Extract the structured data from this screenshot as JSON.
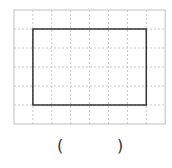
{
  "grid": {
    "left": 14,
    "top": 10,
    "cell_w": 18.9,
    "cell_h": 19,
    "cols": 8,
    "rows": 6,
    "border_color": "#c8c8c8",
    "line_color": "#c8c8c8"
  },
  "rectangle": {
    "col_start": 1,
    "row_start": 1,
    "col_end": 7,
    "row_end": 5,
    "stroke": "#333333"
  },
  "answer": {
    "open_paren": "(",
    "close_paren": ")"
  }
}
